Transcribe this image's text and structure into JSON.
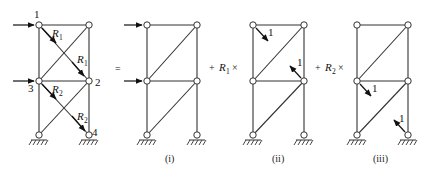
{
  "figure": {
    "main_frame": {
      "node_labels": [
        "1",
        "2",
        "3",
        "4"
      ],
      "redundants": [
        {
          "symbol": "R",
          "subscript": "1"
        },
        {
          "symbol": "R",
          "subscript": "1"
        },
        {
          "symbol": "R",
          "subscript": "2"
        },
        {
          "symbol": "R",
          "subscript": "2"
        }
      ]
    },
    "operators": {
      "equals": "=",
      "plus_r1": {
        "plus": "+",
        "symbol": "R",
        "subscript": "1",
        "times": "×"
      },
      "plus_r2": {
        "plus": "+",
        "symbol": "R",
        "subscript": "2",
        "times": "×"
      }
    },
    "unit_loads": {
      "ii": [
        "1",
        "1"
      ],
      "iii": [
        "1",
        "1"
      ]
    },
    "captions": [
      "(i)",
      "(ii)",
      "(iii)"
    ]
  }
}
